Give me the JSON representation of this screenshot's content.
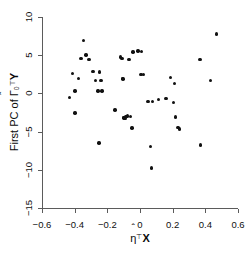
{
  "chart_data": {
    "type": "scatter",
    "title": "",
    "xlabel": "eta-hat^T X",
    "ylabel": "First PC of Gamma-hat_0^T Y",
    "xlabel_parts": {
      "symbol": "η",
      "hat": "ˆ",
      "sup": "⊤",
      "var": "X"
    },
    "ylabel_parts": {
      "prefix": "First PC of ",
      "symbol": "Γ",
      "hat": "ˆ",
      "sub": "0",
      "sup": "⊤",
      "var": "Y"
    },
    "xlim": [
      -0.6,
      0.6
    ],
    "ylim": [
      -15,
      10
    ],
    "xticks": [
      -0.6,
      -0.4,
      -0.2,
      0,
      0.2,
      0.4,
      0.6
    ],
    "xticklabels": [
      "−0.6",
      "−0.4",
      "−0.2",
      "0",
      "0.2",
      "0.4",
      "0.6"
    ],
    "yticks": [
      -15,
      -10,
      -5,
      0,
      5,
      10
    ],
    "yticklabels": [
      "−15",
      "−10",
      "−5",
      "0",
      "5",
      "10"
    ],
    "grid": false,
    "legend": null,
    "marker": "filled-circle",
    "marker_color": "#111111",
    "axis_color": "#5b5b5b",
    "background": "#ffffff",
    "n_points": 48,
    "x": [
      -0.43,
      -0.412,
      -0.398,
      -0.397,
      -0.375,
      -0.362,
      -0.345,
      -0.33,
      -0.313,
      -0.288,
      -0.272,
      -0.258,
      -0.252,
      -0.248,
      -0.24,
      -0.232,
      -0.152,
      -0.118,
      -0.11,
      -0.107,
      -0.103,
      -0.1,
      -0.098,
      -0.092,
      -0.085,
      -0.078,
      -0.068,
      -0.058,
      -0.05,
      -0.042,
      -0.012,
      0.005,
      0.01,
      0.022,
      0.048,
      0.065,
      0.072,
      0.078,
      0.112,
      0.158,
      0.188,
      0.205,
      0.212,
      0.218,
      0.232,
      0.24,
      0.368,
      0.372,
      0.432,
      0.468
    ],
    "y": [
      -0.55,
      2.6,
      0.3,
      -2.55,
      1.95,
      4.55,
      6.95,
      5.05,
      4.45,
      2.85,
      1.65,
      0.3,
      -6.5,
      2.8,
      1.7,
      0.3,
      -2.15,
      4.75,
      4.55,
      1.95,
      1.9,
      -3.15,
      -3.2,
      -3.25,
      -3.05,
      -2.95,
      4.45,
      -3.0,
      -4.55,
      5.4,
      5.55,
      2.45,
      5.45,
      2.5,
      -1.05,
      -6.95,
      -9.75,
      -1.05,
      -0.8,
      -0.65,
      2.05,
      -1.15,
      1.3,
      -3.1,
      -4.5,
      -4.65,
      4.45,
      -6.75,
      1.7,
      7.8
    ]
  },
  "figure": {
    "width": 251,
    "height": 260
  }
}
